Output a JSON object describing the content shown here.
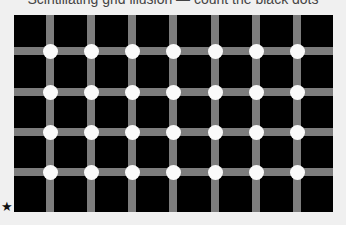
{
  "caption": "Scintillating grid illusion — count the black dots",
  "figure": {
    "type": "scintillating-grid",
    "background_color": "#000000",
    "bar_color": "#7d7d7d",
    "dot_color": "#fafafa",
    "vertical_bar_centers_x": [
      36,
      77,
      118,
      159,
      201,
      242,
      283
    ],
    "horizontal_bar_centers_y": [
      36,
      77,
      117,
      157
    ],
    "rows": 4,
    "columns": 7
  },
  "marker": "★"
}
